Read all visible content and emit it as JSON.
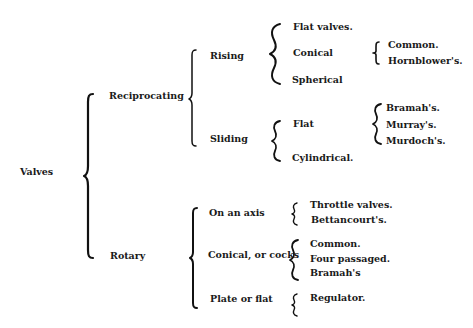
{
  "diagram": {
    "type": "classification-tree",
    "root": {
      "label": "Valves"
    },
    "level1": [
      {
        "label": "Reciprocating"
      },
      {
        "label": "Rotary"
      }
    ],
    "reciprocating": {
      "rising": {
        "label": "Rising",
        "items": [
          {
            "label": "Flat valves."
          },
          {
            "label": "Conical"
          },
          {
            "label": "Spherical"
          }
        ],
        "conical_types": [
          {
            "label": "Common."
          },
          {
            "label": "Hornblower's."
          }
        ]
      },
      "sliding": {
        "label": "Sliding",
        "items": [
          {
            "label": "Flat"
          },
          {
            "label": "Cylindrical."
          }
        ],
        "flat_types": [
          {
            "label": "Bramah's."
          },
          {
            "label": "Murray's."
          },
          {
            "label": "Murdoch's."
          }
        ]
      }
    },
    "rotary": {
      "on_axis": {
        "label": "On an axis",
        "items": [
          {
            "label": "Throttle valves."
          },
          {
            "label": "Bettancourt's."
          }
        ]
      },
      "conical": {
        "label": "Conical, or cocks",
        "items": [
          {
            "label": "Common."
          },
          {
            "label": "Four passaged."
          },
          {
            "label": "Bramah's"
          }
        ]
      },
      "plate": {
        "label": "Plate or flat",
        "items": [
          {
            "label": "Regulator."
          }
        ]
      }
    }
  }
}
